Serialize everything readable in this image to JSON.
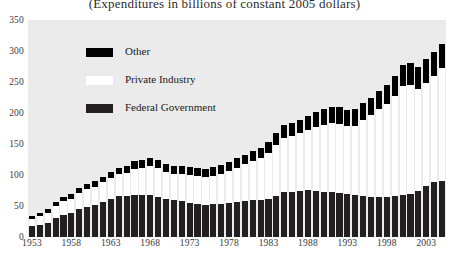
{
  "chart_data": {
    "type": "bar",
    "title": "(Expenditures in billions of constant 2005 dollars)",
    "xlabel": "",
    "ylabel": "",
    "ylim": [
      0,
      350
    ],
    "ytick_values": [
      0,
      50,
      100,
      150,
      200,
      250,
      300,
      350
    ],
    "ytick_labels": [
      "0",
      "50",
      "100",
      "150",
      "200",
      "250",
      "300",
      "350"
    ],
    "grid": false,
    "legend_position": "upper-left",
    "stacked": true,
    "bar_colors": {
      "federal": "#231f20",
      "private": "#ffffff",
      "other": "#000000"
    },
    "categories": [
      "1953",
      "1954",
      "1955",
      "1956",
      "1957",
      "1958",
      "1959",
      "1960",
      "1961",
      "1962",
      "1963",
      "1964",
      "1965",
      "1966",
      "1967",
      "1968",
      "1969",
      "1970",
      "1971",
      "1972",
      "1973",
      "1974",
      "1975",
      "1976",
      "1977",
      "1978",
      "1979",
      "1980",
      "1981",
      "1982",
      "1983",
      "1984",
      "1985",
      "1986",
      "1987",
      "1988",
      "1989",
      "1990",
      "1991",
      "1992",
      "1993",
      "1994",
      "1995",
      "1996",
      "1997",
      "1998",
      "1999",
      "2000",
      "2001",
      "2002",
      "2003",
      "2004",
      "2005"
    ],
    "xtick_labels": [
      "1953",
      "1958",
      "1963",
      "1968",
      "1973",
      "1978",
      "1983",
      "1988",
      "1993",
      "1998",
      "2003"
    ],
    "series": [
      {
        "name": "Federal Government",
        "color": "#231f20",
        "values": [
          17,
          20,
          23,
          30,
          36,
          39,
          45,
          49,
          52,
          57,
          62,
          66,
          66,
          68,
          68,
          68,
          65,
          61,
          59,
          58,
          55,
          53,
          52,
          53,
          54,
          55,
          57,
          58,
          59,
          59,
          62,
          66,
          72,
          73,
          75,
          76,
          74,
          73,
          72,
          71,
          69,
          67,
          66,
          65,
          65,
          64,
          66,
          68,
          70,
          74,
          82,
          88,
          90
        ]
      },
      {
        "name": "Private Industry",
        "color": "#ffffff",
        "values": [
          12,
          14,
          16,
          20,
          22,
          23,
          26,
          28,
          29,
          31,
          33,
          35,
          38,
          42,
          44,
          46,
          46,
          44,
          43,
          43,
          45,
          45,
          44,
          46,
          48,
          51,
          55,
          59,
          64,
          68,
          73,
          82,
          88,
          90,
          92,
          97,
          103,
          108,
          112,
          112,
          110,
          112,
          122,
          131,
          141,
          150,
          161,
          176,
          175,
          164,
          167,
          172,
          182
        ]
      },
      {
        "name": "Other",
        "color": "#000000",
        "values": [
          5,
          5,
          6,
          6,
          7,
          7,
          8,
          8,
          9,
          9,
          10,
          11,
          11,
          12,
          12,
          13,
          13,
          13,
          13,
          13,
          13,
          13,
          13,
          14,
          14,
          15,
          15,
          16,
          16,
          17,
          18,
          19,
          20,
          21,
          22,
          23,
          24,
          25,
          26,
          26,
          26,
          27,
          28,
          29,
          30,
          31,
          33,
          34,
          35,
          36,
          38,
          39,
          40
        ]
      }
    ]
  },
  "legend": {
    "items": [
      {
        "label": "Other",
        "swatch": "other"
      },
      {
        "label": "Private Industry",
        "swatch": "private"
      },
      {
        "label": "Federal Government",
        "swatch": "federal"
      }
    ]
  }
}
